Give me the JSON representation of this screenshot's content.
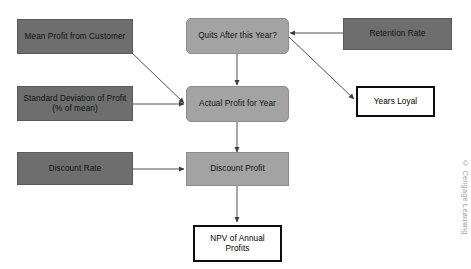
{
  "diagram": {
    "colors": {
      "input_node_fill": "#6e6e6e",
      "calc_node_fill": "#a3a3a3",
      "output_node_fill": "#ffffff",
      "output_node_border": "#0d0d0d",
      "arrow": "#3c3c3c",
      "background": "#ffffff",
      "credit_text": "#9a9a9a"
    },
    "nodes": [
      {
        "id": "mean-profit",
        "label": "Mean Profit from Customer",
        "lines": [
          "Mean Profit from",
          "Customer"
        ],
        "kind": "input",
        "shape": "rectangle"
      },
      {
        "id": "quits-after-this-year",
        "label": "Quits After this Year?",
        "lines": [
          "Quits After",
          "this Year?"
        ],
        "kind": "calculation",
        "shape": "rounded-rectangle"
      },
      {
        "id": "retention-rate",
        "label": "Retention Rate",
        "lines": [
          "Retention Rate"
        ],
        "kind": "input",
        "shape": "rectangle"
      },
      {
        "id": "standard-deviation-of-profit",
        "label": "Standard Deviation of Profit (% of mean)",
        "lines": [
          "Standard Deviation",
          "of Profit (% of mean)"
        ],
        "kind": "input",
        "shape": "rectangle"
      },
      {
        "id": "actual-profit-for-year",
        "label": "Actual Profit for Year",
        "lines": [
          "Actual Profit",
          "for Year"
        ],
        "kind": "calculation",
        "shape": "rounded-rectangle"
      },
      {
        "id": "years-loyal",
        "label": "Years Loyal",
        "lines": [
          "Years Loyal"
        ],
        "kind": "output",
        "shape": "rectangle"
      },
      {
        "id": "discount-rate",
        "label": "Discount Rate",
        "lines": [
          "Discount Rate"
        ],
        "kind": "input",
        "shape": "rectangle"
      },
      {
        "id": "discount-profit",
        "label": "Discount Profit",
        "lines": [
          "Discount Profit"
        ],
        "kind": "calculation",
        "shape": "rectangle"
      },
      {
        "id": "npv-of-annual-profits",
        "label": "NPV of Annual Profits",
        "lines": [
          "NPV of Annual",
          "Profits"
        ],
        "kind": "output",
        "shape": "rectangle"
      }
    ],
    "edges": [
      {
        "from": "mean-profit",
        "to": "actual-profit-for-year",
        "style": "diagonal"
      },
      {
        "from": "standard-deviation-of-profit",
        "to": "actual-profit-for-year",
        "style": "horizontal"
      },
      {
        "from": "quits-after-this-year",
        "to": "actual-profit-for-year",
        "style": "vertical"
      },
      {
        "from": "retention-rate",
        "to": "quits-after-this-year",
        "style": "horizontal"
      },
      {
        "from": "quits-after-this-year",
        "to": "years-loyal",
        "style": "diagonal"
      },
      {
        "from": "actual-profit-for-year",
        "to": "discount-profit",
        "style": "vertical"
      },
      {
        "from": "discount-rate",
        "to": "discount-profit",
        "style": "horizontal"
      },
      {
        "from": "discount-profit",
        "to": "npv-of-annual-profits",
        "style": "vertical"
      }
    ]
  },
  "credit": {
    "text": "© Cengage Learning"
  }
}
